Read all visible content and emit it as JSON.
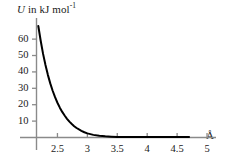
{
  "chart_data": {
    "type": "line",
    "title": "",
    "ylabel": "U in kJ mol",
    "ylabel_variable": "U",
    "ylabel_rest": " in kJ mol",
    "ylabel_exponent": "-1",
    "xlabel": "",
    "xunit": "Å",
    "xlim": [
      2.15,
      5.15
    ],
    "ylim": [
      0,
      68
    ],
    "grid": false,
    "legend": null,
    "xticks": [
      2.5,
      3,
      3.5,
      4,
      4.5,
      5
    ],
    "xtick_labels": [
      "2.5",
      "3",
      "3.5",
      "4",
      "4.5",
      "5"
    ],
    "yticks": [
      10,
      20,
      30,
      40,
      50,
      60
    ],
    "ytick_labels": [
      "10",
      "20",
      "30",
      "40",
      "50",
      "60"
    ],
    "series": [
      {
        "name": "repulsive potential",
        "color": "#000000",
        "x": [
          2.18,
          2.22,
          2.26,
          2.3,
          2.34,
          2.38,
          2.42,
          2.46,
          2.5,
          2.54,
          2.58,
          2.62,
          2.66,
          2.7,
          2.74,
          2.78,
          2.82,
          2.86,
          2.9,
          2.95,
          3.0,
          3.1,
          3.2,
          3.3,
          3.4,
          3.5,
          3.7,
          3.9,
          4.1,
          4.3,
          4.5,
          4.7
        ],
        "y": [
          68.0,
          59.0,
          51.0,
          44.2,
          38.2,
          33.0,
          28.5,
          24.6,
          21.2,
          18.2,
          15.6,
          13.4,
          11.4,
          9.7,
          8.2,
          6.9,
          5.8,
          4.9,
          4.1,
          3.2,
          2.5,
          1.6,
          1.0,
          0.7,
          0.5,
          0.35,
          0.2,
          0.12,
          0.08,
          0.05,
          0.03,
          0.02
        ]
      }
    ]
  },
  "colors": {
    "curve": "#000000",
    "axis": "#808080",
    "text": "#1a1a1a",
    "background": "#ffffff"
  }
}
